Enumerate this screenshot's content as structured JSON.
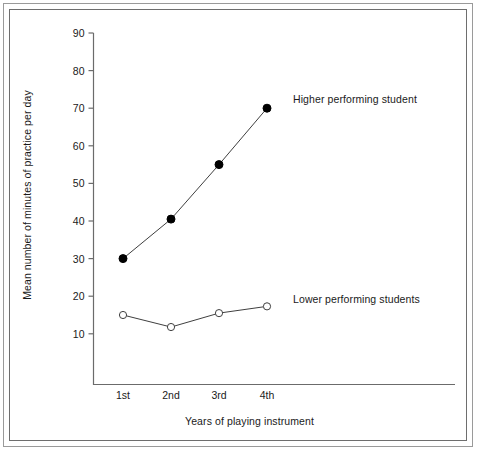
{
  "chart_data": {
    "type": "line",
    "title": "",
    "xlabel": "Years of playing instrument",
    "ylabel": "Mean number of minutes of practice per day",
    "categories": [
      "1st",
      "2nd",
      "3rd",
      "4th"
    ],
    "ylim": [
      0,
      90
    ],
    "yticks": [
      90,
      80,
      70,
      60,
      50,
      40,
      30,
      20,
      10
    ],
    "grid": false,
    "legend_position": "inline-right",
    "series": [
      {
        "name": "Higher performing student",
        "marker": "filled-circle",
        "color": "#000000",
        "values": [
          30,
          40.5,
          55,
          70
        ]
      },
      {
        "name": "Lower performing students",
        "marker": "open-circle",
        "color": "#000000",
        "values": [
          15,
          11.8,
          15.5,
          17.3
        ]
      }
    ],
    "annotations": [
      {
        "text": "Higher performing student",
        "x": "4th",
        "y": 70
      },
      {
        "text": "Lower performing students",
        "x": "4th",
        "y": 20
      }
    ]
  },
  "axis": {
    "y_tick_labels": [
      "90",
      "80",
      "70",
      "60",
      "50",
      "40",
      "30",
      "20",
      "10"
    ],
    "x_tick_labels": [
      "1st",
      "2nd",
      "3rd",
      "4th"
    ],
    "x_title": "Years of playing instrument",
    "y_title": "Mean number of minutes of practice per day"
  },
  "labels": {
    "higher": "Higher performing student",
    "lower": "Lower performing students"
  },
  "colors": {
    "axis": "#6b6b6b",
    "line": "#3f3f3f",
    "marker_fill": "#000000",
    "marker_open": "#ffffff",
    "text": "#1a1a1a",
    "frame_outer": "#9a9a9a",
    "frame_inner": "#6e6e6e",
    "background": "#ffffff"
  }
}
